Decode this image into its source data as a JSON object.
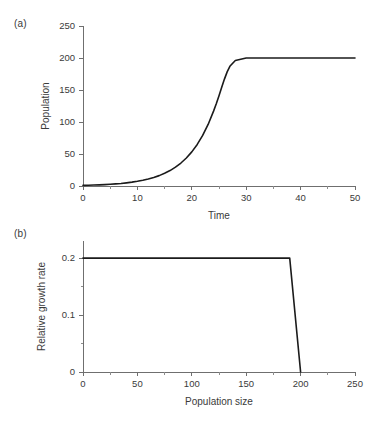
{
  "figure": {
    "background_color": "#ffffff",
    "line_color": "#1b1b1b",
    "axis_color": "#6f6f6f",
    "text_color": "#3a3a3a"
  },
  "panels": {
    "a": {
      "label": "(a)"
    },
    "b": {
      "label": "(b)"
    }
  },
  "chart_data": [
    {
      "type": "line",
      "panel": "(a)",
      "title": "",
      "xlabel": "Time",
      "ylabel": "Population",
      "xlim": [
        0,
        50
      ],
      "ylim": [
        0,
        250
      ],
      "grid": false,
      "legend": "none",
      "x_major_ticks": [
        0,
        10,
        20,
        30,
        40,
        50
      ],
      "x_major_tick_labels": [
        "0",
        "10",
        "20",
        "30",
        "40",
        "50"
      ],
      "x_minor_ticks": [
        5,
        15,
        25,
        35,
        45
      ],
      "y_major_ticks": [
        0,
        50,
        100,
        150,
        200,
        250
      ],
      "y_major_tick_labels": [
        "0",
        "50",
        "100",
        "150",
        "200",
        "250"
      ],
      "y_minor_ticks": [],
      "series": [
        {
          "name": "Population over time",
          "x": [
            0,
            1,
            2,
            3,
            4,
            5,
            6,
            7,
            8,
            9,
            10,
            11,
            12,
            13,
            14,
            15,
            16,
            17,
            18,
            19,
            20,
            21,
            22,
            23,
            24,
            24.5,
            25,
            25.5,
            26,
            26.5,
            27,
            28,
            30,
            35,
            40,
            45,
            50
          ],
          "y": [
            1,
            1.2,
            1.5,
            1.8,
            2.2,
            2.7,
            3.3,
            4.0,
            4.9,
            6.0,
            7.3,
            8.9,
            10.9,
            13.3,
            16.2,
            19.8,
            24.1,
            29.4,
            35.9,
            43.7,
            53.3,
            64.9,
            79.0,
            96.2,
            117.0,
            128.5,
            141.0,
            154.2,
            167.0,
            178.3,
            187.0,
            196.0,
            200.0,
            200.0,
            200.0,
            200.0,
            200.0
          ]
        }
      ],
      "annotations": {
        "carrying_capacity": 200,
        "initial_population": 1,
        "plateau_starts_at_time": 27
      }
    },
    {
      "type": "line",
      "panel": "(b)",
      "title": "",
      "xlabel": "Population size",
      "ylabel": "Relative growth rate",
      "xlim": [
        0,
        250
      ],
      "ylim": [
        0,
        0.23
      ],
      "grid": false,
      "legend": "none",
      "x_major_ticks": [
        0,
        50,
        100,
        150,
        200,
        250
      ],
      "x_major_tick_labels": [
        "0",
        "50",
        "100",
        "150",
        "200",
        "250"
      ],
      "x_minor_ticks": [
        25,
        75,
        125,
        175,
        225
      ],
      "y_major_ticks": [
        0,
        0.1,
        0.2
      ],
      "y_major_tick_labels": [
        "0",
        "0.1",
        "0.2"
      ],
      "y_minor_ticks": [
        0.05,
        0.15
      ],
      "series": [
        {
          "name": "Relative growth rate vs population size",
          "x": [
            0,
            190,
            200
          ],
          "y": [
            0.2,
            0.2,
            0.0
          ]
        }
      ],
      "annotations": {
        "constant_growth_rate": 0.2,
        "threshold_population": 190,
        "zero_growth_population": 200
      }
    }
  ]
}
